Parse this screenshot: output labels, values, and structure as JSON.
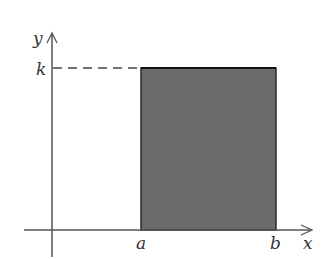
{
  "diagram": {
    "axes": {
      "x_label": "x",
      "y_label": "y"
    },
    "labels": {
      "height": "k",
      "left_bound": "a",
      "right_bound": "b"
    },
    "colors": {
      "fill": "#6b6b6b",
      "stroke": "#222222",
      "axis": "#444444"
    }
  }
}
